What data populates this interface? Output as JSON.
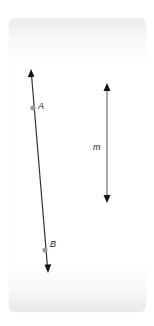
{
  "diagram": {
    "card": {
      "left": 9,
      "top": 18,
      "width": 137,
      "height": 294,
      "corner_radius": 6
    },
    "lines": [
      {
        "name": "line-AB",
        "start": [
          31,
          70
        ],
        "end": [
          48,
          272
        ],
        "color": "#333333",
        "arrows": "both",
        "points": [
          {
            "label": "A",
            "x": 33,
            "y": 108,
            "color": "#999999"
          },
          {
            "label": "B",
            "x": 45,
            "y": 250,
            "color": "#999999"
          }
        ]
      },
      {
        "name": "line-m",
        "label": "m",
        "start": [
          107,
          84
        ],
        "end": [
          107,
          202
        ],
        "color": "#555555",
        "arrows": "both"
      }
    ],
    "labels": {
      "point_a": "A",
      "point_b": "B",
      "line_m": "m"
    }
  }
}
